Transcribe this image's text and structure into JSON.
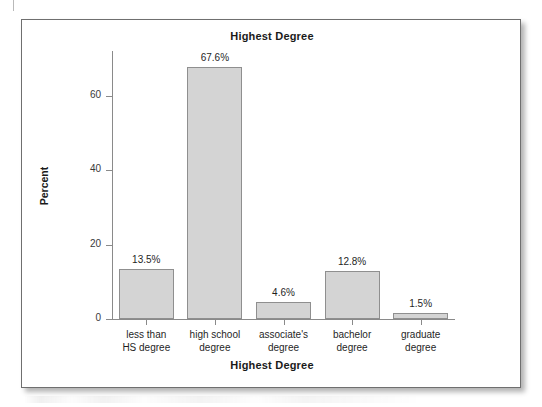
{
  "figure": {
    "title": "Highest Degree",
    "xlabel": "Highest Degree",
    "ylabel": "Percent"
  },
  "chart_data": {
    "type": "bar",
    "title": "Highest Degree",
    "xlabel": "Highest Degree",
    "ylabel": "Percent",
    "categories": [
      "less than HS degree",
      "high school degree",
      "associate's degree",
      "bachelor degree",
      "graduate degree"
    ],
    "category_lines": [
      [
        "less than",
        "HS degree"
      ],
      [
        "high school",
        "degree"
      ],
      [
        "associate's",
        "degree"
      ],
      [
        "bachelor",
        "degree"
      ],
      [
        "graduate",
        "degree"
      ]
    ],
    "values": [
      13.5,
      67.6,
      4.6,
      12.8,
      1.5
    ],
    "value_labels": [
      "13.5%",
      "67.6%",
      "4.6%",
      "12.8%",
      "1.5%"
    ],
    "ylim": [
      0,
      72
    ],
    "yticks": [
      0,
      20,
      40,
      60
    ],
    "ytick_labels": [
      "0",
      "20",
      "40",
      "60"
    ],
    "grid": false,
    "legend": false,
    "bar_fill_color": "#d4d4d4",
    "bar_border_color": "#8f8f8f",
    "axis_color": "#8a8a8a",
    "text_color": "#1f1f1f"
  }
}
